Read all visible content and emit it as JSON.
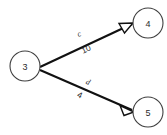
{
  "diagram": {
    "type": "directed-graph",
    "background_color": "#ffffff",
    "edge_color": "#111111",
    "node_stroke_color": "#3f3f3f",
    "text_color": "#2b2b2b",
    "canvas": {
      "width": 167,
      "height": 135
    },
    "nodes": [
      {
        "id": "3",
        "label": "3",
        "cx": 25,
        "cy": 66,
        "r": 15
      },
      {
        "id": "4",
        "label": "4",
        "cx": 148,
        "cy": 23,
        "r": 15
      },
      {
        "id": "5",
        "label": "5",
        "cx": 148,
        "cy": 112,
        "r": 15
      }
    ],
    "edges": [
      {
        "id": "c",
        "name": "c",
        "weight": "10",
        "from": "3",
        "to": "4",
        "directed": true,
        "arrowhead": "open-triangle",
        "x1": 40,
        "y1": 67,
        "x2": 132,
        "y2": 24,
        "name_x": 79,
        "name_y": 34,
        "weight_x": 86,
        "weight_y": 49,
        "angle": -25
      },
      {
        "id": "d",
        "name": "d",
        "weight": "4",
        "from": "3",
        "to": "5",
        "directed": true,
        "arrowhead": "open-triangle",
        "x1": 40,
        "y1": 70,
        "x2": 132,
        "y2": 110,
        "name_x": 88,
        "name_y": 82,
        "weight_x": 80,
        "weight_y": 95,
        "angle": 24
      }
    ]
  }
}
